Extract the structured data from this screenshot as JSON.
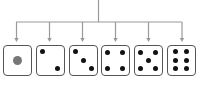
{
  "diagram": {
    "stem": {
      "x": 98.5,
      "y_top": 0,
      "y_bottom": 22
    },
    "bar": {
      "y": 22,
      "x_start": 16,
      "x_end": 182
    },
    "line_color": "#9a9a9a",
    "pip_color": "#111111",
    "single_pip_color": "#777777",
    "faces": [
      {
        "value": 1,
        "x": 3,
        "branch_x": 16.5,
        "pips": [
          [
            0.5,
            0.5
          ]
        ],
        "big": true
      },
      {
        "value": 2,
        "x": 36,
        "branch_x": 49.5,
        "pips": [
          [
            0.22,
            0.2
          ],
          [
            0.78,
            0.8
          ]
        ]
      },
      {
        "value": 3,
        "x": 69,
        "branch_x": 82.5,
        "pips": [
          [
            0.2,
            0.2
          ],
          [
            0.5,
            0.5
          ],
          [
            0.8,
            0.8
          ]
        ]
      },
      {
        "value": 4,
        "x": 101,
        "branch_x": 115.5,
        "pips": [
          [
            0.22,
            0.22
          ],
          [
            0.78,
            0.22
          ],
          [
            0.22,
            0.78
          ],
          [
            0.78,
            0.78
          ]
        ]
      },
      {
        "value": 5,
        "x": 134,
        "branch_x": 148.5,
        "pips": [
          [
            0.22,
            0.22
          ],
          [
            0.78,
            0.22
          ],
          [
            0.5,
            0.5
          ],
          [
            0.22,
            0.78
          ],
          [
            0.78,
            0.78
          ]
        ]
      },
      {
        "value": 6,
        "x": 167,
        "branch_x": 182,
        "pips": [
          [
            0.3,
            0.2
          ],
          [
            0.7,
            0.2
          ],
          [
            0.3,
            0.5
          ],
          [
            0.7,
            0.5
          ],
          [
            0.3,
            0.8
          ],
          [
            0.7,
            0.8
          ]
        ]
      }
    ]
  }
}
